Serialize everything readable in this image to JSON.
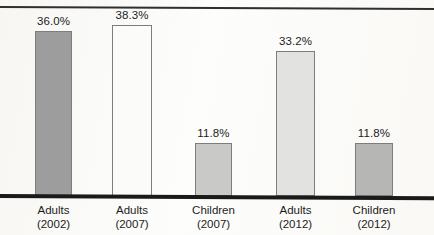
{
  "chart_data": {
    "type": "bar",
    "title": "",
    "subtitle": "",
    "xlabel": "",
    "ylabel": "",
    "ylim": [
      0,
      42
    ],
    "grid": false,
    "legend": "none",
    "value_suffix": "%",
    "categories": [
      "Adults (2002)",
      "Adults (2007)",
      "Children (2007)",
      "Adults (2012)",
      "Children (2012)"
    ],
    "category_lines": [
      [
        "Adults",
        "(2002)"
      ],
      [
        "Adults",
        "(2007)"
      ],
      [
        "Children",
        "(2007)"
      ],
      [
        "Adults",
        "(2012)"
      ],
      [
        "Children",
        "(2012)"
      ]
    ],
    "values": [
      36.0,
      38.3,
      11.8,
      33.2,
      11.8
    ],
    "value_labels": [
      "36.0%",
      "38.3%",
      "11.8%",
      "33.2%",
      "11.8%"
    ],
    "bar_colors": [
      "#9d9d9d",
      "#fbfbf9",
      "#c9c9c7",
      "#e2e2e0",
      "#b6b6b4"
    ],
    "bar_border_color": "#7d7d7d",
    "axis_color": "#1a1a1a"
  },
  "bars": [
    {
      "label_line1": "Adults",
      "label_line2": "(2002)",
      "value_label": "36.0%",
      "value": 36.0,
      "color": "#9d9d9d",
      "left": 35,
      "width": 37,
      "top": 31
    },
    {
      "label_line1": "Adults",
      "label_line2": "(2007)",
      "value_label": "38.3%",
      "value": 38.3,
      "color": "#fbfbf9",
      "left": 112,
      "width": 40,
      "top": 25
    },
    {
      "label_line1": "Children",
      "label_line2": "(2007)",
      "value_label": "11.8%",
      "value": 11.8,
      "color": "#c9c9c7",
      "left": 195,
      "width": 37,
      "top": 143
    },
    {
      "label_line1": "Adults",
      "label_line2": "(2012)",
      "value_label": "33.2%",
      "value": 33.2,
      "color": "#e2e2e0",
      "left": 276,
      "width": 39,
      "top": 51
    },
    {
      "label_line1": "Children",
      "label_line2": "(2012)",
      "value_label": "11.8%",
      "value": 11.8,
      "color": "#b6b6b4",
      "left": 355,
      "width": 38,
      "top": 143
    }
  ]
}
